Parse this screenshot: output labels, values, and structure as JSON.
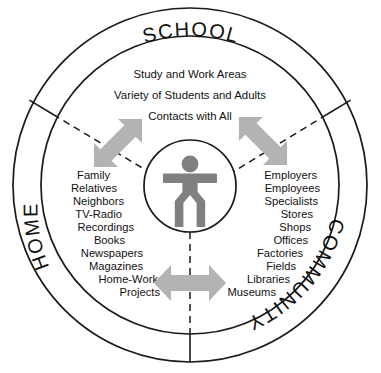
{
  "diagram": {
    "type": "concentric-venn-sectors",
    "colors": {
      "stroke": "#1a1a1a",
      "arrow_fill": "#b3b3b3",
      "figure_fill": "#808080",
      "background": "#ffffff"
    },
    "ring_labels": [
      {
        "id": "school",
        "text": "SCHOOL",
        "position": "top"
      },
      {
        "id": "home",
        "text": "HOME",
        "position": "lower-left"
      },
      {
        "id": "community",
        "text": "COMMUNITY",
        "position": "lower-right"
      }
    ],
    "school_lines": [
      "Study and Work Areas",
      "Variety of Students and Adults",
      "Contacts with All"
    ],
    "home_items": [
      "Family",
      "Relatives",
      "Neighbors",
      "TV-Radio",
      "Recordings",
      "Books",
      "Newspapers",
      "Magazines",
      "Home-Work",
      "Projects"
    ],
    "community_items": [
      "Employers",
      "Employees",
      "Specialists",
      "Stores",
      "Shops",
      "Offices",
      "Factories",
      "Fields",
      "Libraries",
      "Museums"
    ],
    "center": {
      "icon": "person-figure",
      "label": ""
    },
    "arrows": [
      {
        "id": "school-home",
        "direction": "double",
        "orientation": "up-right-down-left"
      },
      {
        "id": "school-community",
        "direction": "double",
        "orientation": "up-left-down-right"
      },
      {
        "id": "home-community",
        "direction": "double",
        "orientation": "horizontal"
      }
    ],
    "dividers": [
      {
        "id": "divider-upper-left",
        "style": "dashed-inner-solid-ring"
      },
      {
        "id": "divider-upper-right",
        "style": "dashed-inner-solid-ring"
      },
      {
        "id": "divider-bottom",
        "style": "dashed-inner-solid-ring"
      }
    ]
  }
}
